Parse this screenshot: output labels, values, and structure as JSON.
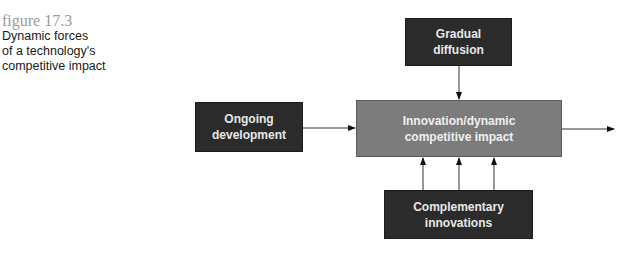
{
  "figure": {
    "label": "figure  17.3",
    "title_lines": [
      "Dynamic forces",
      "of a technology's",
      "competitive impact"
    ]
  },
  "diagram": {
    "nodes": {
      "gradual_diffusion": {
        "line1": "Gradual",
        "line2": "diffusion"
      },
      "ongoing_development": {
        "line1": "Ongoing",
        "line2": "development"
      },
      "innovation_impact": {
        "line1": "Innovation/dynamic",
        "line2": "competitive impact"
      },
      "complementary_innovations": {
        "line1": "Complementary",
        "line2": "innovations"
      }
    },
    "edges": [
      {
        "from": "gradual_diffusion",
        "to": "innovation_impact"
      },
      {
        "from": "ongoing_development",
        "to": "innovation_impact"
      },
      {
        "from": "complementary_innovations",
        "to": "innovation_impact",
        "count": 3
      },
      {
        "from": "innovation_impact",
        "to": "output"
      }
    ]
  },
  "colors": {
    "dark_box": "#2b2b2b",
    "center_box": "#7c7c7c",
    "caption_label": "#9a9a9a"
  }
}
